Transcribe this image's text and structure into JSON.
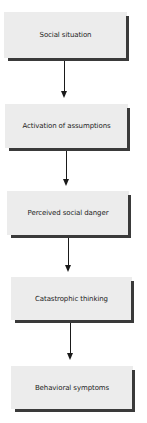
{
  "flowchart": {
    "nodes": [
      {
        "id": "social-situation",
        "label": "Social situation"
      },
      {
        "id": "activation-of-assumptions",
        "label": "Activation of assumptions"
      },
      {
        "id": "perceived-social-danger",
        "label": "Perceived social danger"
      },
      {
        "id": "catastrophic-thinking",
        "label": "Catastrophic thinking"
      },
      {
        "id": "behavioral-symptoms",
        "label": "Behavioral symptoms"
      }
    ],
    "edges": [
      {
        "from": "social-situation",
        "to": "activation-of-assumptions"
      },
      {
        "from": "activation-of-assumptions",
        "to": "perceived-social-danger"
      },
      {
        "from": "perceived-social-danger",
        "to": "catastrophic-thinking"
      },
      {
        "from": "catastrophic-thinking",
        "to": "behavioral-symptoms"
      }
    ],
    "colors": {
      "box_fill": "#ececec",
      "box_shadow": "#3a3a3a",
      "arrow": "#1a1a1a",
      "text": "#1c1c1c"
    }
  }
}
